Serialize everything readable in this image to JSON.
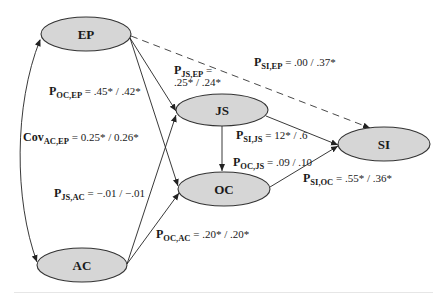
{
  "nodes": {
    "EP": {
      "label": "EP",
      "cx": 86,
      "cy": 34,
      "rx": 45,
      "ry": 17
    },
    "AC": {
      "label": "AC",
      "cx": 82,
      "cy": 265,
      "rx": 45,
      "ry": 17
    },
    "JS": {
      "label": "JS",
      "cx": 222,
      "cy": 110,
      "rx": 46,
      "ry": 16
    },
    "OC": {
      "label": "OC",
      "cx": 224,
      "cy": 189,
      "rx": 46,
      "ry": 17
    },
    "SI": {
      "label": "SI",
      "cx": 384,
      "cy": 144,
      "rx": 46,
      "ry": 17
    }
  },
  "colors": {
    "node_fill": "#d6d6d6",
    "node_stroke": "#333333",
    "edge": "#222222",
    "text": "#1a1a1a"
  },
  "edges": [
    {
      "from": "EP",
      "to": "JS",
      "style": "solid"
    },
    {
      "from": "EP",
      "to": "OC",
      "style": "solid"
    },
    {
      "from": "AC",
      "to": "JS",
      "style": "solid"
    },
    {
      "from": "AC",
      "to": "OC",
      "style": "solid"
    },
    {
      "from": "JS",
      "to": "OC",
      "style": "solid"
    },
    {
      "from": "JS",
      "to": "SI",
      "style": "solid"
    },
    {
      "from": "OC",
      "to": "SI",
      "style": "solid"
    },
    {
      "from": "EP",
      "to": "SI",
      "style": "dashed"
    },
    {
      "from": "EP",
      "to": "AC",
      "style": "curved-bidirectional"
    }
  ],
  "labels": {
    "p_oc_ep": {
      "symbol": "P",
      "sub": "OC,EP",
      "value": " = .45* / .42*"
    },
    "p_js_ep": {
      "symbol": "P",
      "sub": "JS,EP",
      "value": " =",
      "value2": ".25* / .24*"
    },
    "p_si_ep": {
      "symbol": "P",
      "sub": "SI,EP",
      "value": " = .00 / .37*"
    },
    "p_si_js": {
      "symbol": "P",
      "sub": "SI,JS",
      "value": " = 12* / .6"
    },
    "p_oc_js": {
      "symbol": "P",
      "sub": "OC,JS",
      "value": " = .09 / .10"
    },
    "p_si_oc": {
      "symbol": "P",
      "sub": "SI,OC",
      "value": " = .55* / .36*"
    },
    "cov_ac_ep": {
      "symbol": "Cov",
      "sub": "AC,EP",
      "value": " = 0.25* / 0.26*"
    },
    "p_js_ac": {
      "symbol": "P",
      "sub": "JS,AC",
      "value": " = −.01 / −.01"
    },
    "p_oc_ac": {
      "symbol": "P",
      "sub": "OC,AC",
      "value": " = .20* / .20*"
    }
  }
}
